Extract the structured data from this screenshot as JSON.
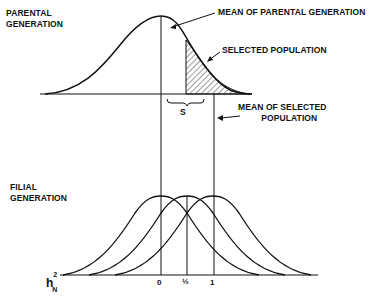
{
  "labels": {
    "parental_line1": "PARENTAL",
    "parental_line2": "GENERATION",
    "mean_parental": "MEAN OF PARENTAL GENERATION",
    "selected_population": "SELECTED POPULATION",
    "s": "S",
    "mean_selected_line1": "MEAN OF SELECTED",
    "mean_selected_line2": "POPULATION",
    "filial_line1": "FILIAL",
    "filial_line2": "GENERATION",
    "h_base": "h",
    "h_sup": "2",
    "h_sub": "N"
  },
  "ticks": [
    "0",
    "½",
    "1"
  ],
  "colors": {
    "ink": "#111111",
    "background": "#ffffff"
  }
}
